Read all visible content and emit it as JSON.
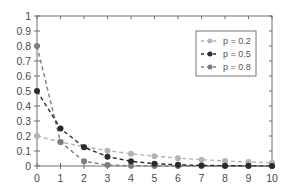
{
  "chart_data": {
    "type": "line",
    "title": "",
    "xlabel": "",
    "ylabel": "",
    "x": [
      0,
      1,
      2,
      3,
      4,
      5,
      6,
      7,
      8,
      9,
      10
    ],
    "xlim": [
      0,
      10
    ],
    "ylim": [
      0,
      1
    ],
    "xticks": [
      "0",
      "1",
      "2",
      "3",
      "4",
      "5",
      "6",
      "7",
      "8",
      "9",
      "10"
    ],
    "yticks": [
      "0",
      "0.1",
      "0.2",
      "0.3",
      "0.4",
      "0.5",
      "0.6",
      "0.7",
      "0.8",
      "0.9",
      "1"
    ],
    "grid": false,
    "legend_position": "upper right",
    "series": [
      {
        "name": "p = 0.2",
        "color": "#b4b4b4",
        "line_style": "dashed",
        "marker": "circle",
        "values": [
          0.2,
          0.16,
          0.128,
          0.1024,
          0.0819,
          0.0655,
          0.0524,
          0.0419,
          0.0336,
          0.0268,
          0.0215
        ]
      },
      {
        "name": "p = 0.5",
        "color": "#2a2a2a",
        "line_style": "dashed",
        "marker": "circle",
        "values": [
          0.5,
          0.25,
          0.125,
          0.0625,
          0.0313,
          0.0156,
          0.0078,
          0.0039,
          0.002,
          0.001,
          0.0005
        ]
      },
      {
        "name": "p = 0.8",
        "color": "#7d7d7d",
        "line_style": "dashed",
        "marker": "circle",
        "values": [
          0.8,
          0.16,
          0.032,
          0.0064,
          0.0013,
          0.0003,
          0.0001,
          0.0,
          0.0,
          0.0,
          0.0
        ]
      }
    ]
  }
}
